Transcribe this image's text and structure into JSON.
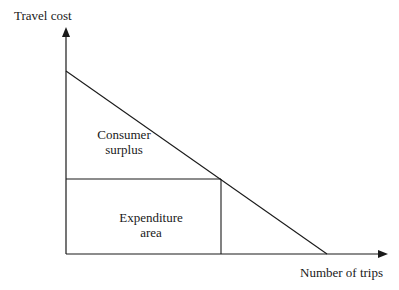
{
  "diagram": {
    "y_axis_label": "Travel cost",
    "x_axis_label": "Number of trips",
    "regions": {
      "consumer_surplus": {
        "line1": "Consumer",
        "line2": "surplus"
      },
      "expenditure": {
        "line1": "Expenditure",
        "line2": "area"
      }
    },
    "colors": {
      "line": "#1a1a1a",
      "background": "#ffffff"
    }
  }
}
